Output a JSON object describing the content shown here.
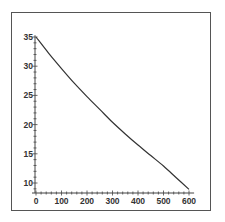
{
  "chart_data": {
    "type": "line",
    "title": "",
    "xlabel": "",
    "ylabel": "",
    "xlim": [
      0,
      600
    ],
    "ylim": [
      8.5,
      35.5
    ],
    "grid": false,
    "legend": null,
    "x_ticks": [
      0,
      100,
      200,
      300,
      400,
      500,
      600
    ],
    "y_ticks": [
      10,
      15,
      20,
      25,
      30,
      35
    ],
    "series": [
      {
        "name": "curve",
        "color": "#333333",
        "x": [
          0,
          50,
          100,
          150,
          200,
          250,
          300,
          350,
          400,
          450,
          500,
          550,
          600
        ],
        "values": [
          35.0,
          32.2,
          29.6,
          27.1,
          24.8,
          22.6,
          20.4,
          18.4,
          16.5,
          14.7,
          12.9,
          10.9,
          8.9
        ]
      }
    ]
  },
  "colors": {
    "frame": "#555555",
    "axis": "#444444",
    "line": "#333333",
    "background": "#ffffff"
  }
}
